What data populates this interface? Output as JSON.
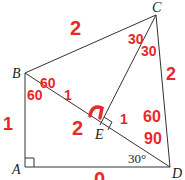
{
  "diagram": {
    "vertices": {
      "A": {
        "label": "A",
        "x": 25,
        "y": 167
      },
      "B": {
        "label": "B",
        "x": 25,
        "y": 73
      },
      "C": {
        "label": "C",
        "x": 156,
        "y": 15
      },
      "D": {
        "label": "D",
        "x": 170,
        "y": 167
      },
      "E": {
        "label": "E",
        "x": 100,
        "y": 125
      }
    },
    "segments": [
      "AB",
      "AD",
      "BC",
      "CD",
      "BD",
      "CE"
    ],
    "right_angles": [
      "A",
      "E"
    ],
    "printed_angle": {
      "vertex": "D",
      "text": "30°"
    },
    "handwritten_annotations": {
      "bc_length": "2",
      "cd_length": "2",
      "ab_length": "1",
      "be_length": "1",
      "ed_length": "1",
      "ce_near_e": "2",
      "angle_bce": "30",
      "angle_ecd": "30",
      "angle_cbd": "60",
      "angle_abd": "60",
      "angle_bde_upper": "60",
      "angle_bde_lower": "90",
      "ad_bottom": "0",
      "right_angle_e": "⌐"
    },
    "colors": {
      "line": "#333333",
      "annotation": "#e8282b"
    }
  }
}
